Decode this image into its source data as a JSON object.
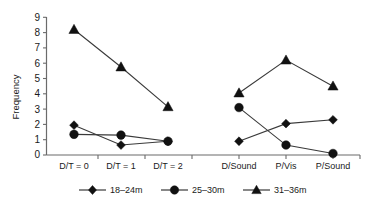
{
  "chart_data": {
    "type": "line",
    "title": "",
    "xlabel": "",
    "ylabel": "Frequency",
    "ylim": [
      0,
      9
    ],
    "yticks": [
      0,
      1,
      2,
      3,
      4,
      5,
      6,
      7,
      8,
      9
    ],
    "grid": false,
    "legend_position": "bottom",
    "categories": [
      "D/T = 0",
      "D/T = 1",
      "D/T = 2",
      "D/Sound",
      "P/Vis",
      "P/Sound"
    ],
    "category_groups": [
      {
        "name": "D/T",
        "categories": [
          "D/T = 0",
          "D/T = 1",
          "D/T = 2"
        ]
      },
      {
        "name": "Modality",
        "categories": [
          "D/Sound",
          "P/Vis",
          "P/Sound"
        ]
      }
    ],
    "series": [
      {
        "name": "18–24m",
        "marker": "diamond",
        "values": [
          1.95,
          0.65,
          0.9,
          0.9,
          2.05,
          2.3
        ]
      },
      {
        "name": "25–30m",
        "marker": "circle",
        "values": [
          1.35,
          1.3,
          0.9,
          3.1,
          0.65,
          0.1
        ]
      },
      {
        "name": "31–36m",
        "marker": "triangle",
        "values": [
          8.2,
          5.75,
          3.15,
          4.05,
          6.2,
          4.5
        ]
      }
    ]
  },
  "axis": {
    "y_title": "Frequency",
    "y_tick_labels": [
      "0",
      "1",
      "2",
      "3",
      "4",
      "5",
      "6",
      "7",
      "8",
      "9"
    ],
    "x_tick_labels": [
      "D/T = 0",
      "D/T = 1",
      "D/T = 2",
      "D/Sound",
      "P/Vis",
      "P/Sound"
    ]
  },
  "legend": {
    "items": [
      {
        "label": "18–24m",
        "marker": "diamond-marker"
      },
      {
        "label": "25–30m",
        "marker": "circle-marker"
      },
      {
        "label": "31–36m",
        "marker": "triangle-marker"
      }
    ]
  },
  "colors": {
    "marker": "#111111",
    "line": "#3a3a3a",
    "axis": "#6b6b6b",
    "text": "#1a1a1a",
    "background": "#ffffff"
  }
}
